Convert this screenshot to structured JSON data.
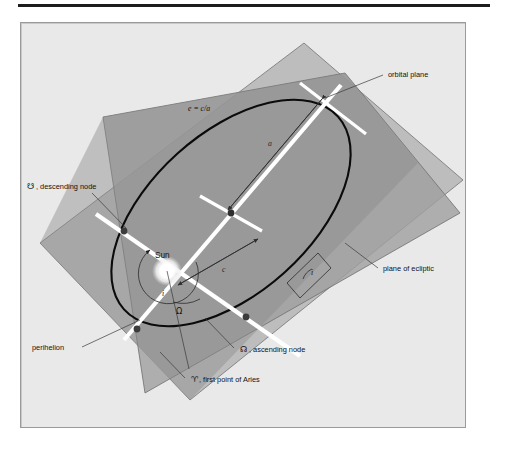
{
  "labels": {
    "orbital_plane": "orbital plane",
    "plane_of_ecliptic": "plane of ecliptic",
    "descending_node_symbol": "☋",
    "descending_node": ", descending node",
    "ascending_node_symbol": "☊",
    "ascending_node": ", ascending node",
    "aries_symbol": "♈",
    "aries": ", first point of Aries",
    "perihelion": "perihelion",
    "sun": "Sun",
    "eccentricity_formula": "e = c/a",
    "semi_major_axis": "a",
    "focal_distance": "c",
    "inclination": "i",
    "longitude_ascending_node": "Ω"
  },
  "colors": {
    "page_background": "#ffffff",
    "panel_background": "#e9e9e9",
    "panel_border": "#9a9a9a",
    "rule": "#1d1d1d",
    "ecliptic_plane_fill": "#a9a9a9",
    "orbital_plane_fill": "#bdbdbd",
    "overlap_fill": "#8e8e8e",
    "plane_edge": "#6e6e6e",
    "orbit_stroke": "#0b0b0b",
    "axis_white": "#ffffff",
    "node_dot": "#3c3c3c",
    "sun_glow": "#ffffff",
    "text": "#111111"
  },
  "geometry": {
    "sun_center": [
      167,
      271
    ],
    "ellipse_center": [
      231,
      213
    ],
    "descending_node": [
      123,
      233
    ],
    "ascending_node": [
      245,
      318
    ],
    "perihelion": [
      137,
      329
    ],
    "aphelion": [
      325,
      96
    ],
    "orbit_rotation_deg": -42,
    "orbit_semi_major_px": 144,
    "orbit_semi_minor_px": 80
  }
}
